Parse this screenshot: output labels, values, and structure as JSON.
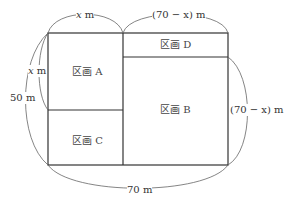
{
  "diagram": {
    "regions": {
      "a": "区画 A",
      "b": "区画 B",
      "c": "区画 C",
      "d": "区画 D"
    },
    "dimensions": {
      "top_left_var": "x",
      "top_left_unit": " m",
      "top_right": "(70 − x) m",
      "left_inner_var": "x",
      "left_inner_unit": " m",
      "left_outer": "50 m",
      "right": "(70 − x) m",
      "bottom": "70 m"
    },
    "colors": {
      "line": "#333333",
      "arc": "#555555"
    }
  }
}
